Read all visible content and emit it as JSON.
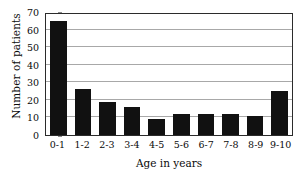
{
  "chart_data": {
    "type": "bar",
    "title": "",
    "xlabel": "Age in years",
    "ylabel": "Number of patients",
    "categories": [
      "0-1",
      "1-2",
      "2-3",
      "3-4",
      "4-5",
      "5-6",
      "6-7",
      "7-8",
      "8-9",
      "9-10"
    ],
    "values": [
      65,
      26,
      19,
      16,
      9,
      12,
      12,
      12,
      11,
      25
    ],
    "ylim": [
      0,
      70
    ],
    "ytick_labels": [
      "0",
      "10",
      "20",
      "30",
      "40",
      "50",
      "60",
      "70"
    ],
    "ytick_values": [
      0,
      10,
      20,
      30,
      40,
      50,
      60,
      70
    ],
    "grid": "horizontal",
    "legend": "none",
    "bar_color": "#111111",
    "grid_color": "#a8a8a8",
    "frame_color": "#2b2b2b",
    "background": "#ffffff"
  }
}
